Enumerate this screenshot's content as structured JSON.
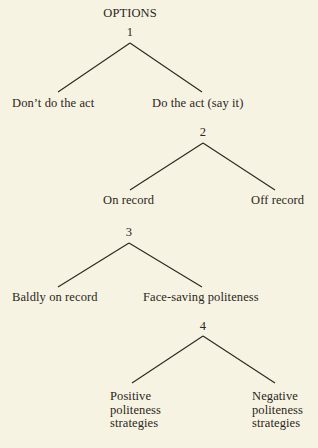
{
  "title": "OPTIONS",
  "nodes": [
    {
      "number": "1",
      "left": "Don’t do the act",
      "right": "Do the act (say it)"
    },
    {
      "number": "2",
      "left": "On record",
      "right": "Off record"
    },
    {
      "number": "3",
      "left": "Baldly on record",
      "right": "Face-saving politeness"
    },
    {
      "number": "4",
      "left": "Positive\npoliteness\nstrategies",
      "right": "Negative\npoliteness\nstrategies"
    }
  ],
  "colors": {
    "background": "#f7f3e3",
    "ink": "#2a2620"
  }
}
